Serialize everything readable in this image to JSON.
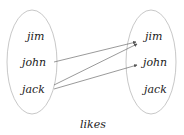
{
  "diagram": {
    "left_set": {
      "items": [
        "jim",
        "john",
        "jack"
      ]
    },
    "right_set": {
      "items": [
        "jim",
        "john",
        "jack"
      ]
    },
    "relations": [
      {
        "from": "john",
        "to": "jim"
      },
      {
        "from": "jack",
        "to": "jim"
      },
      {
        "from": "jack",
        "to": "john"
      }
    ],
    "caption": "likes",
    "colors": {
      "ellipse": "#c8c8c8",
      "arrow": "#555555",
      "text": "#222222"
    }
  }
}
